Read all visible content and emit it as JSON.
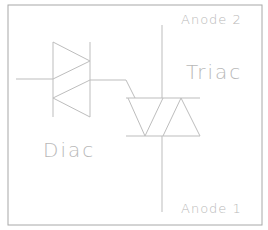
{
  "diagram": {
    "labels": {
      "anode2": "Anode 2",
      "anode1": "Anode 1",
      "triac": "Triac",
      "diac": "Diac"
    },
    "colors": {
      "line": "#bdbdbd",
      "border": "#a0a0a0",
      "text": "#b8b8b8",
      "background": "#ffffff"
    },
    "components": [
      {
        "name": "Diac",
        "type": "bidirectional trigger diode"
      },
      {
        "name": "Triac",
        "type": "bidirectional thyristor",
        "terminals": [
          "Anode 2",
          "Anode 1",
          "Gate"
        ]
      }
    ]
  }
}
